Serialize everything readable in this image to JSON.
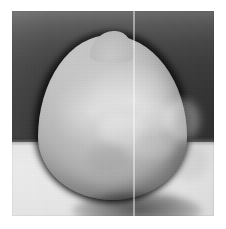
{
  "image": {
    "kind": "photograph",
    "caption": "Grayscale photograph of a single rounded seed-like specimen",
    "subject_label": "specimen",
    "orientation": "upright",
    "colors": {
      "page_background": "#ffffff",
      "backdrop_upper_dark": "#343434",
      "backdrop_lower_light": "#e8e8e8",
      "specimen_body": "#c2c2c2",
      "specimen_highlight": "#e2e2e2",
      "specimen_shadow_rim": "#1a1a1a",
      "seam_line": "#f2f2f2"
    },
    "regions": [
      {
        "name": "upper-dark-backdrop",
        "description": "dark gray gradient field behind the upper half"
      },
      {
        "name": "lower-light-backdrop",
        "description": "pale gray field behind the lower half"
      },
      {
        "name": "horizon-line",
        "description": "soft horizontal boundary between dark and light backdrop"
      },
      {
        "name": "specimen-body",
        "description": "light gray rounded teardrop form with pointed crown"
      },
      {
        "name": "specimen-apex",
        "description": "small pointed tip at the top of the specimen"
      },
      {
        "name": "specimen-contact-shadow",
        "description": "dark shadow rim along the bottom of the specimen"
      },
      {
        "name": "scanner-seam",
        "description": "thin vertical bright line artifact running the full height"
      }
    ],
    "highlights": [
      {
        "name": "upper-right-highlight",
        "description": "brightest diffuse sheen on the upper right of the specimen"
      },
      {
        "name": "left-mottle",
        "description": "softer pale mottled patch on the left of the specimen"
      }
    ]
  }
}
